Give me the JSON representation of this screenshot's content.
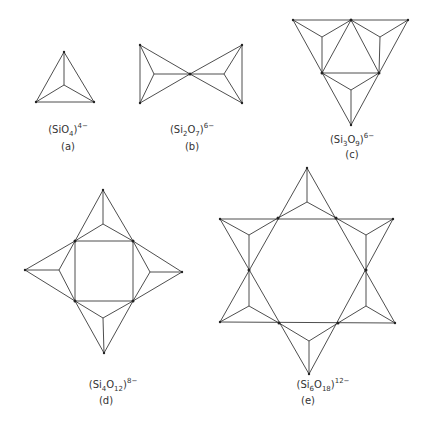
{
  "figures": [
    {
      "id": "a",
      "formula": {
        "open": "(SiO",
        "sub": "4",
        "close": ")",
        "charge": "4−"
      },
      "caption": "(a)"
    },
    {
      "id": "b",
      "formula": {
        "open": "(Si",
        "sub1": "2",
        "mid": "O",
        "sub": "7",
        "close": ")",
        "charge": "6−"
      },
      "caption": "(b)"
    },
    {
      "id": "c",
      "formula": {
        "open": "(Si",
        "sub1": "3",
        "mid": "O",
        "sub": "9",
        "close": ")",
        "charge": "6−"
      },
      "caption": "(c)"
    },
    {
      "id": "d",
      "formula": {
        "open": "(Si",
        "sub1": "4",
        "mid": "O",
        "sub": "12",
        "close": ")",
        "charge": "8−"
      },
      "caption": "(d)"
    },
    {
      "id": "e",
      "formula": {
        "open": "(Si",
        "sub1": "6",
        "mid": "O",
        "sub": "18",
        "close": ")",
        "charge": "12−"
      },
      "caption": "(e)"
    }
  ],
  "colors": {
    "line": "#3a3a3a",
    "text": "#333333",
    "background": "#ffffff"
  }
}
